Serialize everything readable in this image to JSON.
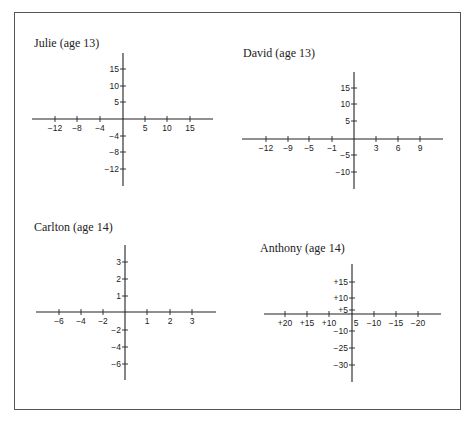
{
  "chart_data": [
    {
      "type": "axes",
      "title": "Julie (age 13)",
      "origin": [
        123,
        119
      ],
      "x_extent": [
        32,
        213
      ],
      "y_extent": [
        53,
        186
      ],
      "x_ticks": [
        {
          "label": "−12",
          "px": 55
        },
        {
          "label": "−8",
          "px": 77
        },
        {
          "label": "−4",
          "px": 100
        },
        {
          "label": "5",
          "px": 145
        },
        {
          "label": "10",
          "px": 167
        },
        {
          "label": "15",
          "px": 190
        }
      ],
      "y_ticks": [
        {
          "label": "15",
          "px": 69
        },
        {
          "label": "10",
          "px": 86
        },
        {
          "label": "5",
          "px": 102
        },
        {
          "label": "−4",
          "px": 136
        },
        {
          "label": "−8",
          "px": 152
        },
        {
          "label": "−12",
          "px": 169
        }
      ]
    },
    {
      "type": "axes",
      "title": "David (age 13)",
      "origin": [
        354,
        139
      ],
      "x_extent": [
        242,
        443
      ],
      "y_extent": [
        72,
        189
      ],
      "x_ticks": [
        {
          "label": "−12",
          "px": 266
        },
        {
          "label": "−9",
          "px": 288
        },
        {
          "label": "−5",
          "px": 309
        },
        {
          "label": "−1",
          "px": 332
        },
        {
          "label": "3",
          "px": 376
        },
        {
          "label": "6",
          "px": 398
        },
        {
          "label": "9",
          "px": 420
        }
      ],
      "y_ticks": [
        {
          "label": "15",
          "px": 88
        },
        {
          "label": "10",
          "px": 104
        },
        {
          "label": "5",
          "px": 121
        },
        {
          "label": "−5",
          "px": 155
        },
        {
          "label": "−10",
          "px": 172
        }
      ]
    },
    {
      "type": "axes",
      "title": "Carlton (age 14)",
      "origin": [
        125,
        312
      ],
      "x_extent": [
        36,
        216
      ],
      "y_extent": [
        245,
        380
      ],
      "x_ticks": [
        {
          "label": "−6",
          "px": 59
        },
        {
          "label": "−4",
          "px": 81
        },
        {
          "label": "−2",
          "px": 103
        },
        {
          "label": "1",
          "px": 147
        },
        {
          "label": "2",
          "px": 170
        },
        {
          "label": "3",
          "px": 192
        }
      ],
      "y_ticks": [
        {
          "label": "3",
          "px": 262
        },
        {
          "label": "2",
          "px": 279
        },
        {
          "label": "1",
          "px": 296
        },
        {
          "label": "−2",
          "px": 330
        },
        {
          "label": "−4",
          "px": 347
        },
        {
          "label": "−6",
          "px": 364
        }
      ]
    },
    {
      "type": "axes",
      "title": "Anthony (age 14)",
      "origin": [
        352,
        314
      ],
      "x_extent": [
        264,
        441
      ],
      "y_extent": [
        264,
        382
      ],
      "x_ticks": [
        {
          "label": "+20",
          "px": 285
        },
        {
          "label": "+15",
          "px": 307
        },
        {
          "label": "+10",
          "px": 329
        },
        {
          "label": "5",
          "px": 356,
          "no_tick": true,
          "label_dx": 0
        },
        {
          "label": "−10",
          "px": 374
        },
        {
          "label": "−15",
          "px": 396
        },
        {
          "label": "−20",
          "px": 418
        }
      ],
      "y_ticks": [
        {
          "label": "+15",
          "px": 282
        },
        {
          "label": "+10",
          "px": 298
        },
        {
          "label": "+5",
          "px": 310
        },
        {
          "label": "−10",
          "px": 331
        },
        {
          "label": "−25",
          "px": 348
        },
        {
          "label": "−30",
          "px": 365
        }
      ]
    }
  ],
  "titles": {
    "julie": "Julie (age 13)",
    "david": "David (age 13)",
    "carlton": "Carlton (age 14)",
    "anthony": "Anthony (age 14)"
  }
}
